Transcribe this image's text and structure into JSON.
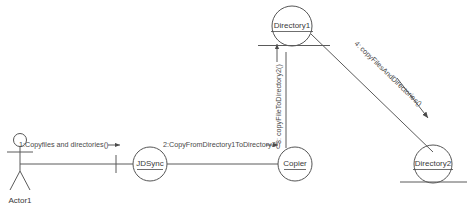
{
  "diagram": {
    "kind": "uml-communication-diagram",
    "background_color": "#ffffff",
    "line_color": "#5a5a5a",
    "text_color": "#3a3a3a"
  },
  "actors": [
    {
      "id": "actor1",
      "label": "Actor1",
      "icon": "stick-figure-actor-icon"
    }
  ],
  "objects": [
    {
      "id": "jdsync",
      "label": "JDSync",
      "underlined": true
    },
    {
      "id": "copier",
      "label": "Copier",
      "underlined": true
    },
    {
      "id": "directory1",
      "label": "Directory1",
      "underlined": true
    },
    {
      "id": "directory2",
      "label": "Directory2",
      "underlined": true
    }
  ],
  "messages": [
    {
      "sequence": "1",
      "label": "1:Copyfiles and directories()",
      "from": "actor1",
      "to": "jdsync",
      "direction": "right",
      "arrow": "filled"
    },
    {
      "sequence": "2",
      "label": "2:CopyFromDirectory1ToDirectory2()",
      "from": "jdsync",
      "to": "copier",
      "direction": "right",
      "arrow": "filled"
    },
    {
      "sequence": "3",
      "label": "3: copyFileToDirectory2()",
      "from": "copier",
      "to": "directory1",
      "direction": "up",
      "arrow": "filled"
    },
    {
      "sequence": "4",
      "label": "4: copyFilesAndDirectories()",
      "from": "directory1",
      "to": "directory2",
      "direction": "down-right",
      "arrow": "filled"
    }
  ],
  "links": [
    {
      "id": "link-actor1-jdsync",
      "from": "actor1",
      "to": "jdsync"
    },
    {
      "id": "link-jdsync-copier",
      "from": "jdsync",
      "to": "copier"
    },
    {
      "id": "link-copier-directory1",
      "from": "copier",
      "to": "directory1"
    },
    {
      "id": "link-directory1-directory2",
      "from": "directory1",
      "to": "directory2"
    }
  ]
}
